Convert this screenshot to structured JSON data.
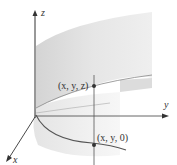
{
  "figure": {
    "axes": {
      "x": {
        "label": "x"
      },
      "y": {
        "label": "y"
      },
      "z": {
        "label": "z"
      }
    },
    "points": [
      {
        "label": "(x, y, z)"
      },
      {
        "label": "(x, y, 0)"
      }
    ],
    "colors": {
      "surface_light": "#ececec",
      "surface_dark": "#d9d9d9",
      "curve": "#555555",
      "axis": "#333333",
      "background": "#ffffff"
    }
  }
}
